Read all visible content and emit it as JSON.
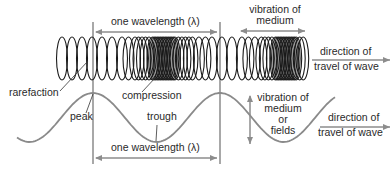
{
  "colors": {
    "spring": "#1a1a1a",
    "wave": "#8a8a8a",
    "guide": "#a8a8a8",
    "arrow": "#8c8c8c",
    "text": "#2a2a2a",
    "leader": "#333333"
  },
  "longitudinal": {
    "wavelength_label": "one wavelength (λ)",
    "vibration_label_line1": "vibration of",
    "vibration_label_line2": "medium",
    "direction_label_line1": "direction of",
    "direction_label_line2": "travel of wave",
    "rarefaction_label": "rarefaction",
    "compression_label": "compression"
  },
  "transverse": {
    "peak_label": "peak",
    "trough_label": "trough",
    "wavelength_label": "one wavelength (λ)",
    "vibration_label_line1": "vibration of",
    "vibration_label_line2": "medium",
    "vibration_label_line3": "or",
    "vibration_label_line4": "fields",
    "direction_label_line1": "direction of",
    "direction_label_line2": "travel of wave"
  }
}
